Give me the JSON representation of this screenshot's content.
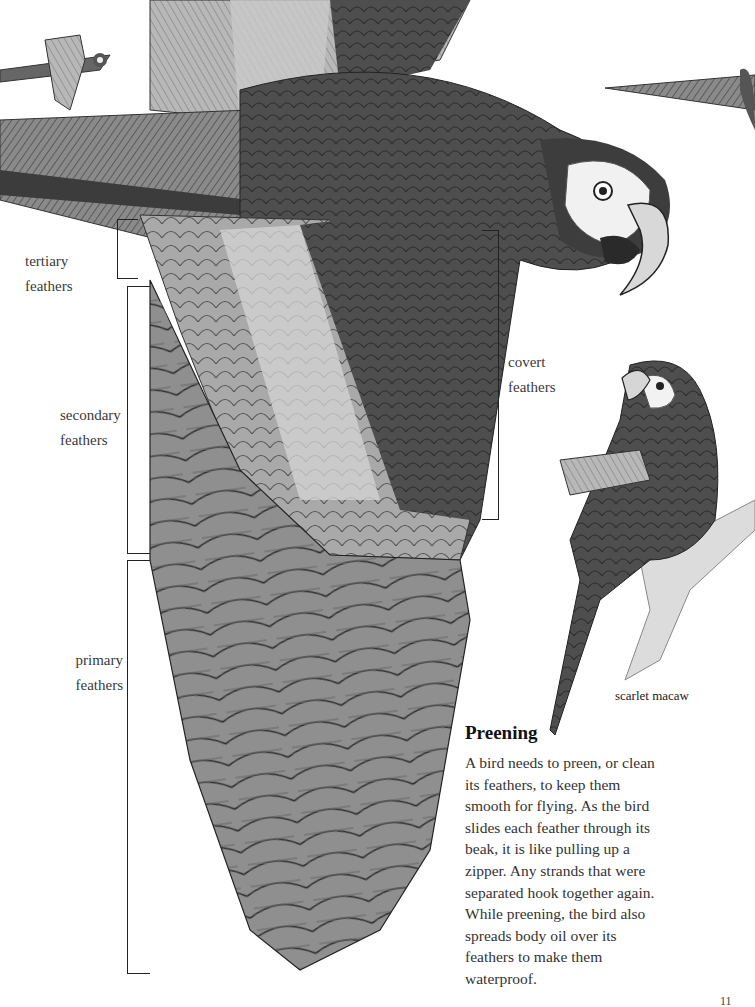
{
  "illustration": {
    "main_subject": "macaw in flight, underside of wing",
    "secondary_subjects": [
      "small macaw in flight (top left)",
      "macaw wingtip (top right)",
      "scarlet macaw preening on branch"
    ]
  },
  "labels": {
    "tertiary": {
      "line1": "tertiary",
      "line2": "feathers"
    },
    "secondary": {
      "line1": "secondary",
      "line2": "feathers"
    },
    "primary": {
      "line1": "primary",
      "line2": "feathers"
    },
    "covert": {
      "line1": "covert",
      "line2": "feathers"
    }
  },
  "caption": {
    "scarlet_macaw": "scarlet macaw"
  },
  "sidebar": {
    "heading": "Preening",
    "lines": [
      "A bird needs to preen, or clean",
      "its feathers, to keep them",
      "smooth for flying. As the bird",
      "slides each feather through its",
      "beak, it is like pulling up a",
      "zipper. Any strands that were",
      "separated hook together again.",
      "While preening, the bird also",
      "spreads body oil over its",
      "feathers to make them",
      "waterproof."
    ]
  },
  "page_number": "11"
}
